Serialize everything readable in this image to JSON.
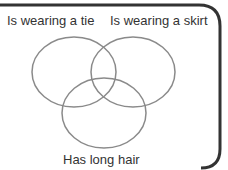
{
  "diagram": {
    "type": "venn",
    "sets": [
      {
        "label": "Is wearing a tie"
      },
      {
        "label": "Is wearing a skirt"
      },
      {
        "label": "Has long hair"
      }
    ],
    "colors": {
      "frame": "#333333",
      "circle": "#8a8a8a",
      "text": "#333333"
    }
  }
}
